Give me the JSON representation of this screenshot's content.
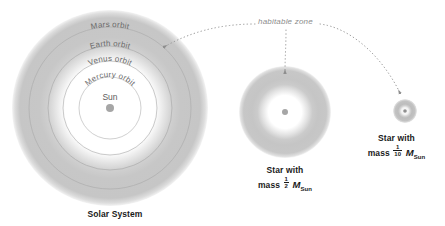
{
  "figure": {
    "background": "#ffffff"
  },
  "colors": {
    "habitable_zone_band": "#c8c8c8",
    "habitable_zone_outer_fade": "#e8e8e8",
    "inner_disc": "#ffffff",
    "orbit_line": "#b5b5b5",
    "star_dot": "#a6a6a6",
    "label_text": "#6b6b6b",
    "caption_text": "#1a1a1a",
    "leader_line": "#9e9e9e",
    "hz_label_text": "#8c8c8c"
  },
  "annotation": {
    "habitable_zone_label": "habitable zone"
  },
  "systems": [
    {
      "id": "solar-system",
      "caption_line1": "Solar System",
      "center": {
        "x": 110,
        "y": 108
      },
      "habitable_zone_outer_radius": 98,
      "habitable_zone_inner_radius": 62,
      "star_dot_radius": 4,
      "orbits": [
        {
          "name": "Mars orbit",
          "radius": 81
        },
        {
          "name": "Earth orbit",
          "radius": 62
        },
        {
          "name": "Venus orbit",
          "radius": 47
        },
        {
          "name": "Mercury orbit",
          "radius": 31
        }
      ],
      "star_label": "Sun"
    },
    {
      "id": "half-solar-mass-star",
      "caption_line1": "Star with",
      "caption_mass_prefix": "mass",
      "caption_fraction_numerator": "1",
      "caption_fraction_denominator": "2",
      "caption_mass_symbol": "M",
      "caption_mass_subscript": "Sun",
      "center": {
        "x": 285,
        "y": 112
      },
      "habitable_zone_outer_radius": 46,
      "habitable_zone_inner_radius": 22,
      "star_dot_radius": 3
    },
    {
      "id": "tenth-solar-mass-star",
      "caption_line1": "Star with",
      "caption_mass_prefix": "mass",
      "caption_fraction_numerator": "1",
      "caption_fraction_denominator": "10",
      "caption_mass_symbol": "M",
      "caption_mass_subscript": "Sun",
      "center": {
        "x": 405,
        "y": 111
      },
      "habitable_zone_outer_radius": 12,
      "habitable_zone_inner_radius": 6,
      "star_dot_radius": 1.8
    }
  ]
}
